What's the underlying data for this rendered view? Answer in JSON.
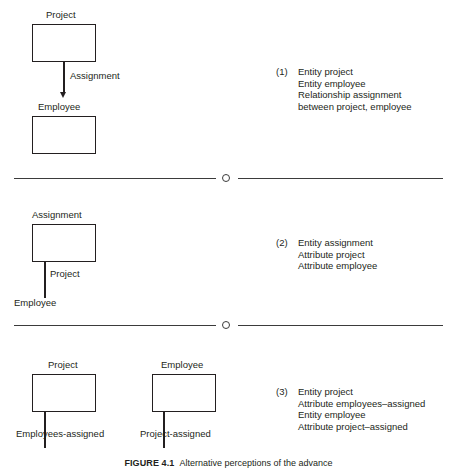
{
  "figure": {
    "caption_label": "FIGURE 4.1",
    "caption_text": "Alternative perceptions of the advance",
    "diagram_type": "entity-relationship-alternatives"
  },
  "panels": [
    {
      "id": "panel-1",
      "number": "(1)",
      "boxes": [
        {
          "label": "Project"
        },
        {
          "label": "Employee"
        }
      ],
      "edge_labels": [
        "Assignment"
      ],
      "description": "Entity project\nEntity employee\nRelationship assignment\nbetween project, employee"
    },
    {
      "id": "panel-2",
      "number": "(2)",
      "boxes": [
        {
          "label": "Assignment"
        }
      ],
      "edge_labels": [
        "Project",
        "Employee"
      ],
      "description": "Entity assignment\nAttribute project\nAttribute employee"
    },
    {
      "id": "panel-3",
      "number": "(3)",
      "boxes": [
        {
          "label": "Project"
        },
        {
          "label": "Employee"
        }
      ],
      "edge_labels": [
        "Employees-assigned",
        "Project-assigned"
      ],
      "description": "Entity project\nAttribute employees–assigned\nEntity employee\nAttribute project–assigned"
    }
  ],
  "dividers": [
    {
      "marker": "circle"
    },
    {
      "marker": "circle"
    }
  ],
  "colors": {
    "ink": "#231f20",
    "rule": "#3b3b3b",
    "paper": "#ffffff"
  }
}
